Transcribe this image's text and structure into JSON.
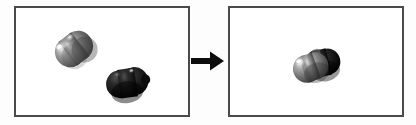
{
  "figure": {
    "title": "Two separate blob objects merge into a single occluded object",
    "background_color": "#fdfdfd",
    "width": 416,
    "height": 125
  },
  "panels": [
    {
      "id": "before",
      "label": "before-panel",
      "border_color": "#4a4a4a",
      "background_color": "#ffffff",
      "objects": [
        {
          "name": "light-gray-blob",
          "label": "light gray bean shaped blob",
          "fill_color": "#6e6e6e",
          "highlight_color": "#f2f2f2",
          "shadow_color": "#2e2e2e",
          "position": "upper-left",
          "rotation_deg": -38
        },
        {
          "name": "dark-blob",
          "label": "dark black bean shaped blob",
          "fill_color": "#151515",
          "highlight_color": "#5a5a5a",
          "shadow_color": "#000000",
          "position": "lower-right",
          "rotation_deg": -8
        }
      ]
    },
    {
      "id": "after",
      "label": "after-panel",
      "border_color": "#4a4a4a",
      "background_color": "#ffffff",
      "objects": [
        {
          "name": "dark-blob",
          "label": "dark black blob behind",
          "fill_color": "#151515",
          "highlight_color": "#5a5a5a",
          "shadow_color": "#000000",
          "position": "center-right",
          "rotation_deg": -14
        },
        {
          "name": "light-gray-blob",
          "label": "light gray blob in front occluding the dark blob",
          "fill_color": "#6e6e6e",
          "highlight_color": "#f2f2f2",
          "shadow_color": "#2e2e2e",
          "position": "center-left",
          "rotation_deg": -20
        }
      ]
    }
  ],
  "arrow": {
    "name": "transition-arrow",
    "direction": "right",
    "color": "#0d0d0d"
  }
}
